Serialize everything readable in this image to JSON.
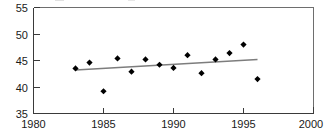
{
  "chart_data": {
    "type": "scatter",
    "title": "",
    "subtitle": "",
    "xlabel": "",
    "ylabel": "",
    "xlim": [
      1980,
      2000
    ],
    "ylim": [
      35,
      55
    ],
    "x_ticks": [
      1980,
      1985,
      1990,
      1995,
      2000
    ],
    "y_ticks": [
      35,
      40,
      45,
      50,
      55
    ],
    "x_tick_labels": [
      "1980",
      "1985",
      "1990",
      "1995",
      "2000"
    ],
    "y_tick_labels": [
      "35",
      "40",
      "45",
      "50",
      "55"
    ],
    "grid": false,
    "legend": false,
    "legend_position": "none",
    "marker": "diamond",
    "marker_color": "#000000",
    "trendline_color": "#7d7d7d",
    "series": [
      {
        "name": "observations",
        "type": "scatter",
        "x": [
          1983,
          1984,
          1985,
          1986,
          1987,
          1988,
          1989,
          1990,
          1991,
          1992,
          1993,
          1994,
          1995,
          1996
        ],
        "values": [
          43.5,
          44.6,
          39.2,
          45.4,
          42.9,
          45.2,
          44.2,
          43.6,
          46.0,
          42.6,
          45.2,
          46.4,
          48.0,
          41.5
        ]
      },
      {
        "name": "trend-line",
        "type": "line",
        "x": [
          1983,
          1996
        ],
        "values": [
          43.2,
          45.2
        ]
      }
    ]
  },
  "axes": {
    "y_axis_name": "value-axis",
    "x_axis_name": "year-axis"
  }
}
